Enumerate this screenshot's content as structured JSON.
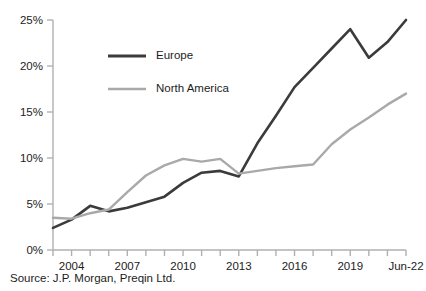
{
  "source_note": "Source: J.P. Morgan, Preqin Ltd.",
  "legend": {
    "position": "inside-top-left",
    "items": [
      {
        "name": "europe",
        "label": "Europe",
        "color": "#3b3b3b"
      },
      {
        "name": "north-america",
        "label": "North America",
        "color": "#a9a9a9"
      }
    ]
  },
  "axes": {
    "y_ticks": [
      "0%",
      "5%",
      "10%",
      "15%",
      "20%",
      "25%"
    ],
    "x_ticks": [
      "2004",
      "2007",
      "2010",
      "2013",
      "2016",
      "2019",
      "Jun-22"
    ]
  },
  "chart_data": {
    "type": "line",
    "title": "",
    "xlabel": "",
    "ylabel": "",
    "ylim": [
      0,
      25
    ],
    "grid": false,
    "legend_position": "inside-top-left",
    "x": [
      "2003",
      "2004",
      "2005",
      "2006",
      "2007",
      "2008",
      "2009",
      "2010",
      "2011",
      "2012",
      "2013",
      "2014",
      "2015",
      "2016",
      "2017",
      "2018",
      "2019",
      "2020",
      "2021",
      "Jun-22"
    ],
    "x_tick_labels": [
      "2004",
      "2007",
      "2010",
      "2013",
      "2016",
      "2019",
      "Jun-22"
    ],
    "x_tick_values": [
      "2004",
      "2007",
      "2010",
      "2013",
      "2016",
      "2019",
      "Jun-22"
    ],
    "y_tick_values": [
      0,
      5,
      10,
      15,
      20,
      25
    ],
    "y_tick_labels": [
      "0%",
      "5%",
      "10%",
      "15%",
      "20%",
      "25%"
    ],
    "series": [
      {
        "name": "Europe",
        "color": "#3b3b3b",
        "values": [
          2.4,
          3.3,
          4.8,
          4.2,
          4.6,
          5.2,
          5.8,
          7.3,
          8.4,
          8.6,
          8.0,
          11.6,
          14.6,
          17.7,
          19.8,
          21.9,
          24.0,
          20.9,
          22.6,
          25.0
        ]
      },
      {
        "name": "North America",
        "color": "#a9a9a9",
        "values": [
          3.5,
          3.4,
          4.0,
          4.4,
          6.3,
          8.1,
          9.2,
          9.9,
          9.6,
          9.9,
          8.3,
          8.6,
          8.9,
          9.1,
          9.3,
          11.5,
          13.1,
          14.4,
          15.8,
          17.0
        ]
      }
    ]
  }
}
